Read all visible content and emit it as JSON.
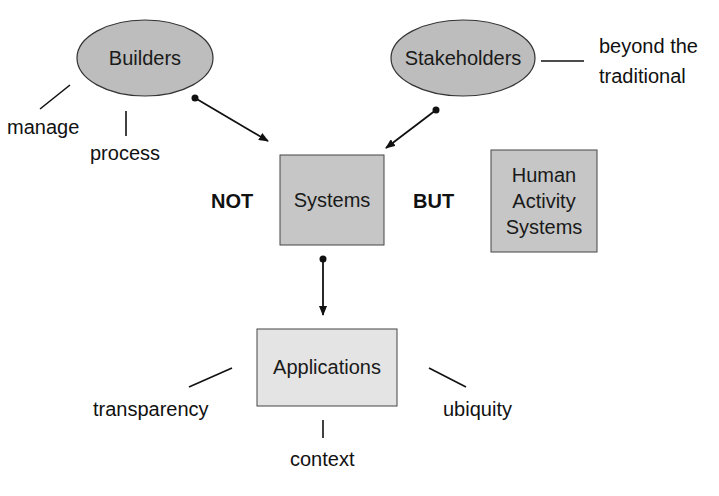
{
  "diagram": {
    "nodes": {
      "builders": {
        "label": "Builders",
        "shape": "ellipse",
        "fill": "#bdbdbd"
      },
      "stakeholders": {
        "label": "Stakeholders",
        "shape": "ellipse",
        "fill": "#bdbdbd"
      },
      "systems": {
        "label": "Systems",
        "shape": "rectangle",
        "fill": "#c4c4c4"
      },
      "human_activity_systems": {
        "label_lines": [
          "Human",
          "Activity",
          "Systems"
        ],
        "shape": "rectangle",
        "fill": "#c4c4c4"
      },
      "applications": {
        "label": "Applications",
        "shape": "rectangle",
        "fill": "#e6e6e6"
      }
    },
    "annotations": {
      "manage": "manage",
      "process": "process",
      "beyond_line1": "beyond the",
      "beyond_line2": "traditional",
      "not": "NOT",
      "but": "BUT",
      "transparency": "transparency",
      "ubiquity": "ubiquity",
      "context": "context"
    },
    "edges": [
      {
        "from": "builders",
        "to": "systems",
        "style": "dot-to-arrow"
      },
      {
        "from": "stakeholders",
        "to": "systems",
        "style": "dot-to-arrow"
      },
      {
        "from": "systems",
        "to": "applications",
        "style": "dot-to-arrow"
      }
    ],
    "colors": {
      "stroke": "#222222",
      "text": "#111111"
    }
  }
}
